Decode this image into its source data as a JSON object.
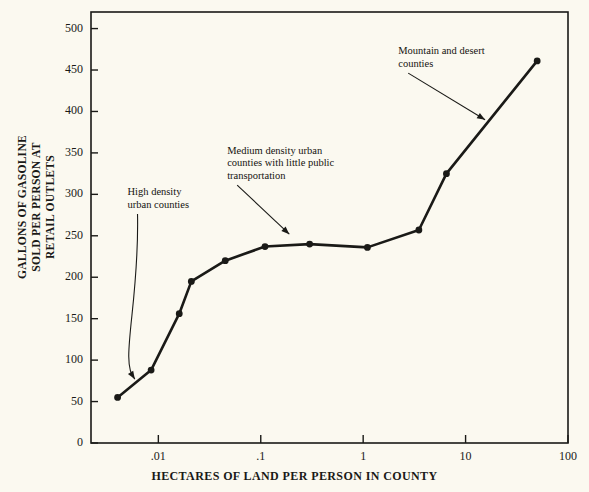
{
  "figure": {
    "background": "#fbf9f0",
    "ink": "#1a1a17",
    "plot_box": {
      "left": 91,
      "top": 12,
      "right": 568,
      "bottom": 443
    }
  },
  "chart_data": {
    "type": "line",
    "title": "",
    "xlabel": "HECTARES OF LAND PER PERSON IN COUNTY",
    "ylabel": "GALLONS OF GASOLINE\nSOLD PER PERSON AT\nRETAIL OUTLETS",
    "xscale": "log",
    "yscale": "linear",
    "xlim": [
      0.0022,
      100
    ],
    "ylim": [
      0,
      520
    ],
    "xticks": [
      0.01,
      0.1,
      1,
      10,
      100
    ],
    "xticklabels": [
      ".01",
      ".1",
      "1",
      "10",
      "100"
    ],
    "yticks": [
      0,
      50,
      100,
      150,
      200,
      250,
      300,
      350,
      400,
      450,
      500
    ],
    "yticklabels": [
      "0",
      "50",
      "100",
      "150",
      "200",
      "250",
      "300",
      "350",
      "400",
      "450",
      "500"
    ],
    "grid": false,
    "legend": null,
    "marker": "filled-circle",
    "series": [
      {
        "name": "Gallons of gasoline sold per person",
        "x": [
          0.004,
          0.0085,
          0.016,
          0.021,
          0.045,
          0.11,
          0.3,
          1.1,
          3.5,
          6.5,
          50
        ],
        "y": [
          55,
          88,
          156,
          195,
          220,
          237,
          240,
          236,
          257,
          325,
          461
        ]
      }
    ],
    "annotations": [
      {
        "id": "high-density",
        "text": "High density\nurban counties",
        "text_x": 0.005,
        "text_y": 310,
        "arrow_to_x": 0.0059,
        "arrow_to_y": 77,
        "curved": true
      },
      {
        "id": "medium-density",
        "text": "Medium density urban\ncounties with little public\ntransportation",
        "text_x": 0.047,
        "text_y": 360,
        "arrow_to_x": 0.19,
        "arrow_to_y": 252,
        "curved": false
      },
      {
        "id": "mountain-desert",
        "text": "Mountain and desert\ncounties",
        "text_x": 2.2,
        "text_y": 480,
        "arrow_to_x": 15.5,
        "arrow_to_y": 390,
        "curved": false
      }
    ]
  },
  "top_cropped_text": ""
}
